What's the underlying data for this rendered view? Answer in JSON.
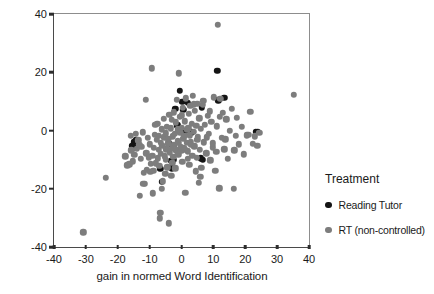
{
  "chart_data": {
    "type": "scatter",
    "title": "",
    "xlabel": "gain in normed Word Identification",
    "ylabel": "gain in normed Passage Comprehension",
    "xlim": [
      -40,
      40
    ],
    "ylim": [
      -40,
      40
    ],
    "xticks": [
      -40,
      -30,
      -20,
      -10,
      0,
      10,
      20,
      30,
      40
    ],
    "yticks": [
      -40,
      -20,
      0,
      20,
      40
    ],
    "grid": false,
    "legend": {
      "title": "Treatment",
      "position": "right",
      "entries": [
        {
          "name": "Reading Tutor",
          "color": "#141414"
        },
        {
          "name": "RT (non-controlled)",
          "color": "#7d7d7d"
        }
      ]
    },
    "series": [
      {
        "name": "Reading Tutor",
        "color": "#141414",
        "points": [
          [
            -15.0,
            -4.0
          ],
          [
            -15.5,
            -5.2
          ],
          [
            -14.6,
            -5.9
          ],
          [
            -14.2,
            -3.3
          ],
          [
            -6.6,
            -13.2
          ],
          [
            -6.2,
            -17.6
          ],
          [
            -3.6,
            -4.6
          ],
          [
            -3.2,
            -10.4
          ],
          [
            -2.4,
            -10.0
          ],
          [
            -3.0,
            -13.0
          ],
          [
            -2.0,
            7.4
          ],
          [
            -1.3,
            1.8
          ],
          [
            -0.6,
            13.6
          ],
          [
            0.3,
            9.8
          ],
          [
            0.6,
            7.2
          ],
          [
            1.2,
            -0.2
          ],
          [
            2.0,
            9.6
          ],
          [
            3.2,
            -0.6
          ],
          [
            6.4,
            8.0
          ],
          [
            6.0,
            -9.6
          ],
          [
            6.6,
            -10.0
          ],
          [
            11.2,
            20.4
          ],
          [
            11.5,
            10.4
          ],
          [
            13.4,
            11.2
          ],
          [
            23.4,
            -0.4
          ],
          [
            24.0,
            -0.4
          ]
        ]
      },
      {
        "name": "RT (non-controlled)",
        "color": "#7d7d7d",
        "points": [
          [
            -30.8,
            -35.0
          ],
          [
            -23.8,
            -16.2
          ],
          [
            -17.6,
            -8.8
          ],
          [
            -17.0,
            -12.0
          ],
          [
            -16.4,
            -11.6
          ],
          [
            -16.0,
            -1.8
          ],
          [
            -15.2,
            -10.6
          ],
          [
            -14.8,
            -8.4
          ],
          [
            -14.4,
            -1.2
          ],
          [
            -14.0,
            -6.2
          ],
          [
            -13.6,
            -3.4
          ],
          [
            -13.0,
            -22.4
          ],
          [
            -12.6,
            -5.6
          ],
          [
            -12.2,
            -0.6
          ],
          [
            -12.0,
            -18.4
          ],
          [
            -11.6,
            -18.2
          ],
          [
            -11.2,
            10.6
          ],
          [
            -11.0,
            -7.8
          ],
          [
            -10.6,
            -2.6
          ],
          [
            -10.2,
            -9.2
          ],
          [
            -10.0,
            -4.8
          ],
          [
            -9.6,
            -11.4
          ],
          [
            -9.4,
            21.4
          ],
          [
            -9.2,
            -8.6
          ],
          [
            -9.0,
            -21.6
          ],
          [
            -8.6,
            -6.0
          ],
          [
            -8.4,
            -1.4
          ],
          [
            -8.0,
            -11.2
          ],
          [
            -7.8,
            -3.2
          ],
          [
            -7.6,
            2.4
          ],
          [
            -7.4,
            -9.6
          ],
          [
            -7.2,
            -6.6
          ],
          [
            -7.0,
            -12.2
          ],
          [
            -6.8,
            -30.2
          ],
          [
            -6.6,
            -28.2
          ],
          [
            -6.4,
            -8.0
          ],
          [
            -6.2,
            0.4
          ],
          [
            -6.0,
            -5.2
          ],
          [
            -5.8,
            -17.4
          ],
          [
            -5.6,
            4.0
          ],
          [
            -5.4,
            -2.4
          ],
          [
            -5.2,
            -8.8
          ],
          [
            -5.0,
            -1.0
          ],
          [
            -4.8,
            -6.4
          ],
          [
            -4.6,
            1.2
          ],
          [
            -4.4,
            -12.6
          ],
          [
            -4.2,
            -4.4
          ],
          [
            -4.0,
            -31.8
          ],
          [
            -3.8,
            5.4
          ],
          [
            -3.6,
            -7.6
          ],
          [
            -3.4,
            0.8
          ],
          [
            -3.2,
            -15.6
          ],
          [
            -3.0,
            3.6
          ],
          [
            -2.8,
            -2.0
          ],
          [
            -2.6,
            -9.0
          ],
          [
            -2.4,
            6.2
          ],
          [
            -2.2,
            -5.0
          ],
          [
            -2.0,
            -13.0
          ],
          [
            -1.8,
            2.8
          ],
          [
            -1.6,
            -6.8
          ],
          [
            -1.4,
            10.6
          ],
          [
            -1.2,
            -3.6
          ],
          [
            -1.0,
            -8.2
          ],
          [
            -0.8,
            19.6
          ],
          [
            -0.6,
            4.6
          ],
          [
            -0.4,
            -0.8
          ],
          [
            -0.2,
            -5.6
          ],
          [
            0.0,
            1.0
          ],
          [
            0.2,
            -10.8
          ],
          [
            0.4,
            7.8
          ],
          [
            0.6,
            -2.8
          ],
          [
            0.8,
            -6.0
          ],
          [
            1.0,
            3.2
          ],
          [
            1.2,
            -21.4
          ],
          [
            1.4,
            11.0
          ],
          [
            1.6,
            -4.2
          ],
          [
            1.8,
            0.2
          ],
          [
            2.0,
            -7.2
          ],
          [
            2.2,
            5.8
          ],
          [
            2.4,
            -11.8
          ],
          [
            2.6,
            -1.6
          ],
          [
            2.8,
            8.4
          ],
          [
            3.0,
            -3.8
          ],
          [
            3.2,
            2.2
          ],
          [
            3.4,
            -8.6
          ],
          [
            3.6,
            12.0
          ],
          [
            3.8,
            -0.4
          ],
          [
            4.0,
            -5.4
          ],
          [
            4.2,
            6.8
          ],
          [
            4.4,
            -14.0
          ],
          [
            4.6,
            1.6
          ],
          [
            4.8,
            -9.4
          ],
          [
            5.0,
            9.2
          ],
          [
            5.2,
            -2.2
          ],
          [
            5.4,
            -18.0
          ],
          [
            5.6,
            4.2
          ],
          [
            5.8,
            -6.6
          ],
          [
            6.0,
            0.6
          ],
          [
            6.2,
            -12.8
          ],
          [
            6.6,
            8.8
          ],
          [
            7.0,
            -4.0
          ],
          [
            7.4,
            2.0
          ],
          [
            7.8,
            -7.8
          ],
          [
            8.2,
            5.0
          ],
          [
            8.6,
            -1.2
          ],
          [
            9.0,
            -10.2
          ],
          [
            9.4,
            3.0
          ],
          [
            9.8,
            -5.8
          ],
          [
            10.2,
            11.4
          ],
          [
            10.6,
            -13.8
          ],
          [
            11.0,
            1.4
          ],
          [
            11.4,
            36.2
          ],
          [
            11.8,
            -19.8
          ],
          [
            12.2,
            10.8
          ],
          [
            12.6,
            -2.6
          ],
          [
            13.0,
            6.0
          ],
          [
            13.4,
            -6.4
          ],
          [
            14.0,
            3.8
          ],
          [
            14.6,
            -9.8
          ],
          [
            15.2,
            0.0
          ],
          [
            15.8,
            7.4
          ],
          [
            16.4,
            -20.0
          ],
          [
            16.6,
            -6.8
          ],
          [
            17.0,
            -1.8
          ],
          [
            17.4,
            4.4
          ],
          [
            18.0,
            -4.8
          ],
          [
            19.0,
            1.2
          ],
          [
            19.6,
            -8.2
          ],
          [
            20.4,
            -1.6
          ],
          [
            21.0,
            -1.4
          ],
          [
            21.6,
            6.4
          ],
          [
            22.4,
            -4.6
          ],
          [
            23.0,
            -2.0
          ],
          [
            23.8,
            -5.2
          ],
          [
            24.4,
            -0.8
          ],
          [
            35.2,
            12.2
          ],
          [
            -12.8,
            -9.8
          ],
          [
            -11.8,
            -14.6
          ],
          [
            -10.8,
            -13.4
          ],
          [
            -9.8,
            -14.2
          ],
          [
            -8.8,
            -13.8
          ],
          [
            -8.2,
            2.0
          ],
          [
            -7.1,
            -1.8
          ],
          [
            -6.1,
            -20.0
          ],
          [
            -5.1,
            -14.8
          ],
          [
            -4.1,
            -2.8
          ],
          [
            -3.1,
            -6.2
          ],
          [
            -2.1,
            -1.2
          ],
          [
            -1.1,
            0.4
          ],
          [
            -0.1,
            -7.0
          ],
          [
            0.9,
            -1.8
          ],
          [
            1.9,
            -9.8
          ],
          [
            2.9,
            -5.0
          ],
          [
            3.9,
            9.0
          ],
          [
            4.9,
            -3.2
          ],
          [
            5.9,
            -16.0
          ],
          [
            6.9,
            10.2
          ],
          [
            7.9,
            -2.4
          ],
          [
            8.9,
            6.6
          ],
          [
            9.9,
            -4.4
          ],
          [
            10.9,
            -7.4
          ],
          [
            12.0,
            4.8
          ],
          [
            13.8,
            -3.0
          ],
          [
            -0.9,
            -4.2
          ],
          [
            0.1,
            5.2
          ],
          [
            1.1,
            -6.4
          ],
          [
            2.1,
            0.8
          ],
          [
            -2.9,
            -11.0
          ],
          [
            -4.9,
            -10.0
          ],
          [
            -6.4,
            -4.2
          ],
          [
            -13.2,
            -5.0
          ],
          [
            -15.8,
            -6.8
          ]
        ]
      }
    ]
  }
}
